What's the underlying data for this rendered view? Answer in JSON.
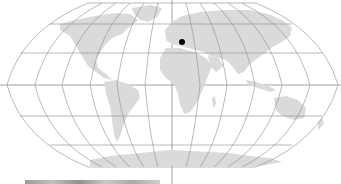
{
  "map": {
    "projection": "Robinson",
    "graticule_spacing_deg": 30,
    "colors": {
      "background": "#ffffff",
      "land": "#d9d9d9",
      "graticule": "#8c8c8c",
      "marker": "#000000",
      "central_meridian": "#7a7a7a"
    },
    "marker": {
      "label": "location-marker",
      "region": "Southeastern Europe",
      "x": 182,
      "y": 42
    },
    "legend": {
      "text": ""
    }
  }
}
